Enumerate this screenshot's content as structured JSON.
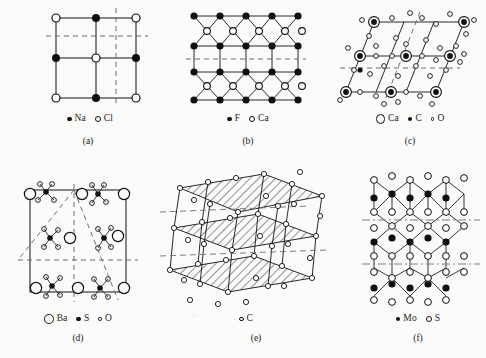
{
  "figure": {
    "background_color": "#fbfbfa",
    "line_color": "#101010",
    "panel_count": 6
  },
  "panels": [
    {
      "id": "a",
      "caption": "(a)",
      "structure": "halite",
      "description": "Square net projection, 3 by 3 lattice with alternating Na and Cl sites, dashed mirror lines",
      "legend": [
        {
          "marker": "filled-sm",
          "label": "Na"
        },
        {
          "marker": "open-md",
          "label": "Cl"
        }
      ]
    },
    {
      "id": "b",
      "caption": "(b)",
      "structure": "fluorite",
      "description": "Layered net of F rows and Ca rows with cross-linked bonds, dashed mirror line through centre",
      "legend": [
        {
          "marker": "filled-sm",
          "label": "F"
        },
        {
          "marker": "open-md",
          "label": "Ca"
        }
      ]
    },
    {
      "id": "c",
      "caption": "(c)",
      "structure": "calcite",
      "description": "Rhombohedral projection, Ca sites as large rings with filled centres, carbonate groups of C and O",
      "legend": [
        {
          "marker": "open-lg",
          "label": "Ca"
        },
        {
          "marker": "filled-sm",
          "label": "C"
        },
        {
          "marker": "open-xs",
          "label": "O"
        }
      ]
    },
    {
      "id": "d",
      "caption": "(d)",
      "structure": "barite",
      "description": "Orthorhombic cell with Ba at corners and sulphate tetrahedra, dashed diagonal symmetry lines",
      "legend": [
        {
          "marker": "open-lg",
          "label": "Ba"
        },
        {
          "marker": "filled-sm",
          "label": "S"
        },
        {
          "marker": "open-xs",
          "label": "O"
        }
      ]
    },
    {
      "id": "e",
      "caption": "(e)",
      "structure": "graphite",
      "description": "Stacked hatched sheets of carbon rings in oblique perspective with dashed glide traces",
      "legend": [
        {
          "marker": "open-sm",
          "label": "C"
        }
      ]
    },
    {
      "id": "f",
      "caption": "(f)",
      "structure": "molybdenite",
      "description": "Layered Mo and S net with dash-dot interlayer traces",
      "legend": [
        {
          "marker": "filled-sm",
          "label": "Mo"
        },
        {
          "marker": "open-md",
          "label": "S"
        }
      ]
    }
  ]
}
